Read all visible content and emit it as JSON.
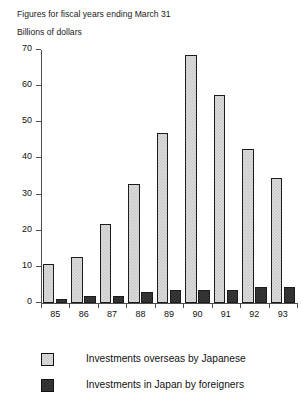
{
  "captions": {
    "fiscal_note": "Figures for fiscal years ending March 31",
    "units": "Billions of dollars"
  },
  "legend": {
    "items": [
      {
        "label": "Investments overseas by Japanese",
        "swatch": "light-gray-hatched",
        "color": "#dcdcdc"
      },
      {
        "label": "Investments in Japan by foreigners",
        "swatch": "dark-gray-hatched",
        "color": "#3c3c3c"
      }
    ]
  },
  "axis": {
    "y_ticks": [
      "0",
      "10",
      "20",
      "30",
      "40",
      "50",
      "60",
      "70"
    ],
    "x_ticks": [
      "85",
      "86",
      "87",
      "88",
      "89",
      "90",
      "91",
      "92",
      "93"
    ]
  },
  "chart_data": {
    "type": "bar",
    "title": "",
    "subtitle": "Figures for fiscal years ending March 31",
    "xlabel": "",
    "ylabel": "Billions of dollars",
    "ylim": [
      0,
      70
    ],
    "ytick_step": 10,
    "grid": false,
    "legend_position": "bottom",
    "categories": [
      "85",
      "86",
      "87",
      "88",
      "89",
      "90",
      "91",
      "92",
      "93"
    ],
    "series": [
      {
        "name": "Investments overseas by Japanese",
        "color": "#dcdcdc",
        "values": [
          10.8,
          12.8,
          22.0,
          33.0,
          47.0,
          68.5,
          57.5,
          42.5,
          34.5
        ]
      },
      {
        "name": "Investments in Japan by foreigners",
        "color": "#3c3c3c",
        "values": [
          1.0,
          2.0,
          2.0,
          3.0,
          3.5,
          3.5,
          3.5,
          4.5,
          4.5
        ]
      }
    ]
  }
}
